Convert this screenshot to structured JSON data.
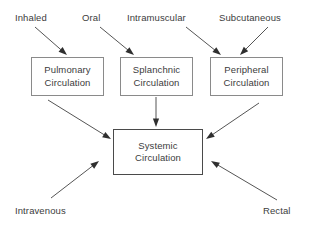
{
  "diagram": {
    "background_color": "#ffffff",
    "text_color": "#3c3c3c",
    "box_border_color": "#8a8a8a",
    "primary_box_border_color": "#4a4a4a",
    "arrow_color": "#555555",
    "routes": [
      {
        "id": "inhaled",
        "label": "Inhaled",
        "x": 15,
        "y": 12
      },
      {
        "id": "oral",
        "label": "Oral",
        "x": 82,
        "y": 12
      },
      {
        "id": "intramuscular",
        "label": "Intramuscular",
        "x": 127,
        "y": 12
      },
      {
        "id": "subcutaneous",
        "label": "Subcutaneous",
        "x": 219,
        "y": 12
      },
      {
        "id": "intravenous",
        "label": "Intravenous",
        "x": 15,
        "y": 205
      },
      {
        "id": "rectal",
        "label": "Rectal",
        "x": 263,
        "y": 205
      }
    ],
    "nodes": [
      {
        "id": "pulmonary",
        "line1": "Pulmonary",
        "line2": "Circulation",
        "x": 31,
        "y": 57,
        "w": 73,
        "h": 39,
        "emphasis": false
      },
      {
        "id": "splanchnic",
        "line1": "Splanchnic",
        "line2": "Circulation",
        "x": 120,
        "y": 57,
        "w": 73,
        "h": 39,
        "emphasis": false
      },
      {
        "id": "peripheral",
        "line1": "Peripheral",
        "line2": "Circulation",
        "x": 210,
        "y": 57,
        "w": 73,
        "h": 39,
        "emphasis": false
      },
      {
        "id": "systemic",
        "line1": "Systemic",
        "line2": "Circulation",
        "x": 113,
        "y": 129,
        "w": 90,
        "h": 46,
        "emphasis": true
      }
    ],
    "arrows": [
      {
        "id": "inhaled-to-pulmonary",
        "from": "inhaled",
        "to": "pulmonary",
        "x1": 35,
        "y1": 27,
        "x2": 67,
        "y2": 55
      },
      {
        "id": "oral-to-splanchnic",
        "from": "oral",
        "to": "splanchnic",
        "x1": 100,
        "y1": 27,
        "x2": 134,
        "y2": 55
      },
      {
        "id": "intramuscular-to-peripheral",
        "from": "intramuscular",
        "to": "peripheral",
        "x1": 186,
        "y1": 27,
        "x2": 221,
        "y2": 55
      },
      {
        "id": "subcutaneous-to-peripheral",
        "from": "subcutaneous",
        "to": "peripheral",
        "x1": 268,
        "y1": 27,
        "x2": 240,
        "y2": 55
      },
      {
        "id": "pulmonary-to-systemic",
        "from": "pulmonary",
        "to": "systemic",
        "x1": 48,
        "y1": 100,
        "x2": 111,
        "y2": 139
      },
      {
        "id": "splanchnic-to-systemic",
        "from": "splanchnic",
        "to": "systemic",
        "x1": 156,
        "y1": 97,
        "x2": 156,
        "y2": 127
      },
      {
        "id": "peripheral-to-systemic",
        "from": "peripheral",
        "to": "systemic",
        "x1": 259,
        "y1": 103,
        "x2": 206,
        "y2": 139
      },
      {
        "id": "intravenous-to-systemic",
        "from": "intravenous",
        "to": "systemic",
        "x1": 51,
        "y1": 198,
        "x2": 99,
        "y2": 161
      },
      {
        "id": "rectal-to-systemic",
        "from": "rectal",
        "to": "systemic",
        "x1": 277,
        "y1": 200,
        "x2": 211,
        "y2": 161
      }
    ]
  }
}
